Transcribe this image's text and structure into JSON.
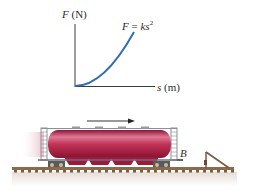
{
  "graph": {
    "y_axis_label": {
      "var": "F",
      "unit": "(N)"
    },
    "x_axis_label": {
      "var": "s",
      "unit": "(m)"
    },
    "equation": {
      "lhs": "F",
      "eq": " = ",
      "coef": "ks",
      "exp": "2"
    }
  },
  "scene": {
    "point_label": "B",
    "motion_direction": "right",
    "car_type": "hopper-railcar",
    "colors": {
      "curve": "#2f6fae",
      "axes": "#3a3a3a",
      "tank": "#b01f45",
      "tank_highlight": "#e07a95",
      "frame": "#8a8f99",
      "rail": "#8c6a4e",
      "ballast": "#e9e2db"
    }
  }
}
